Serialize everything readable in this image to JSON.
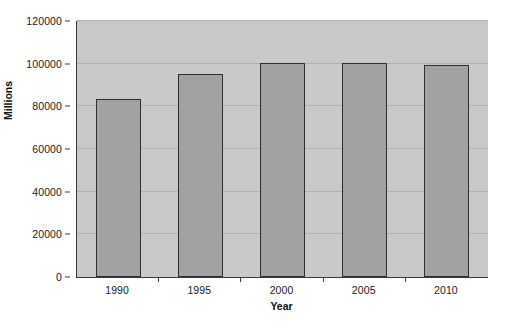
{
  "chart_data": {
    "type": "bar",
    "title": "",
    "subtitle": "",
    "xlabel": "Year",
    "ylabel": "Millions",
    "categories": [
      "1990",
      "1995",
      "2000",
      "2005",
      "2010"
    ],
    "values": [
      83500,
      95300,
      100200,
      100500,
      99300
    ],
    "series": [
      {
        "name": "Millions",
        "values": [
          83500,
          95300,
          100200,
          100500,
          99300
        ]
      }
    ],
    "ylim": [
      0,
      120000
    ],
    "ytick_values": [
      0,
      20000,
      40000,
      60000,
      80000,
      100000,
      120000
    ],
    "ytick_labels": [
      "0",
      "20000",
      "40000",
      "60000",
      "80000",
      "100000",
      "120000"
    ],
    "xtick_labels": [
      "1990",
      "1995",
      "2000",
      "2005",
      "2010"
    ],
    "grid": true,
    "grid_axis": "y",
    "legend": false,
    "legend_position": "none",
    "annotations": []
  },
  "style": {
    "figure_background": "#ffffff",
    "plot_background": "#c9c9c9",
    "bar_fill": "#a2a2a2",
    "bar_border": "#2e2e2e",
    "gridline_color": "#b0b0b0",
    "axis_color": "#3a3a3a",
    "text_color": "#1a1a1a"
  }
}
